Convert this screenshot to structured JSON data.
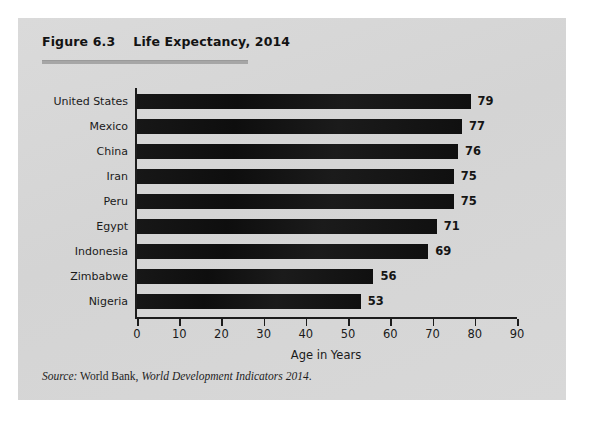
{
  "figure": {
    "number": "Figure 6.3",
    "title": "Life Expectancy, 2014",
    "title_full": "Figure 6.3    Life Expectancy, 2014"
  },
  "source": {
    "label": "Source:",
    "organization": " World Bank, ",
    "publication": "World Development Indicators 2014",
    "period": ".",
    "full": "Source: World Bank, World Development Indicators 2014."
  },
  "chart_data": {
    "type": "bar",
    "orientation": "horizontal",
    "title": "Life Expectancy, 2014",
    "xlabel": "Age in Years",
    "ylabel": "",
    "xlim": [
      0,
      90
    ],
    "xticks": [
      0,
      10,
      20,
      30,
      40,
      50,
      60,
      70,
      80,
      90
    ],
    "xtick_labels": [
      "0",
      "10",
      "20",
      "30",
      "40",
      "50",
      "60",
      "70",
      "80",
      "90"
    ],
    "grid": false,
    "legend": false,
    "bar_color": "#141414",
    "categories": [
      "United States",
      "Mexico",
      "China",
      "Iran",
      "Peru",
      "Egypt",
      "Indonesia",
      "Zimbabwe",
      "Nigeria"
    ],
    "values": [
      79,
      77,
      76,
      75,
      75,
      71,
      69,
      56,
      53
    ],
    "value_labels": [
      "79",
      "77",
      "76",
      "75",
      "75",
      "71",
      "69",
      "56",
      "53"
    ]
  },
  "colors": {
    "card_background": "#d6d6d6",
    "page_background": "#ffffff",
    "bar": "#141414",
    "axis": "#1c1c1c",
    "rule": "#a6a6a6",
    "text": "#1a1a1a"
  }
}
